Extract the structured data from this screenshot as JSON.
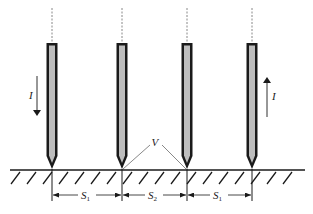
{
  "diagram": {
    "type": "four-probe electrode arrangement",
    "colors": {
      "stroke": "#1a1a1a",
      "electrode_fill": "#bdbdbd",
      "dashed": "#888888",
      "background": "#ffffff"
    },
    "electrodes": [
      {
        "id": 1,
        "x": 52
      },
      {
        "id": 2,
        "x": 122
      },
      {
        "id": 3,
        "x": 187
      },
      {
        "id": 4,
        "x": 252
      }
    ],
    "current_labels": {
      "left": {
        "text": "I",
        "direction": "down"
      },
      "right": {
        "text": "I",
        "direction": "up"
      }
    },
    "voltage_label": {
      "text": "V"
    },
    "spacings": [
      {
        "main": "S",
        "sub": "1"
      },
      {
        "main": "S",
        "sub": "2"
      },
      {
        "main": "S",
        "sub": "1"
      }
    ]
  }
}
